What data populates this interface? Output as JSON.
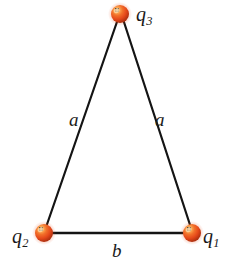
{
  "figure": {
    "type": "physics-diagram",
    "background_color": "#ffffff",
    "width": 232,
    "height": 269
  },
  "style": {
    "sphere_color": "#e8501e",
    "sphere_highlight_color": "#ffd9a8",
    "sphere_shadow_color": "#a32908",
    "line_color": "#141414",
    "label_color": "#1a1a1a",
    "sphere_radius": 9,
    "line_width": 2.2
  },
  "charges": [
    {
      "id": "q1",
      "label": "q",
      "subscript": "1",
      "position": {
        "x": 192,
        "y": 233
      },
      "label_position": "right"
    },
    {
      "id": "q2",
      "label": "q",
      "subscript": "2",
      "position": {
        "x": 44,
        "y": 233
      },
      "label_position": "left"
    },
    {
      "id": "q3",
      "label": "q",
      "subscript": "3",
      "position": {
        "x": 120,
        "y": 14
      },
      "label_position": "right"
    }
  ],
  "sides": [
    {
      "id": "side-left",
      "label": "a",
      "from": "q2",
      "to": "q3",
      "label_position": {
        "x": 69,
        "y": 110
      }
    },
    {
      "id": "side-right",
      "label": "a",
      "from": "q3",
      "to": "q1",
      "label_position": {
        "x": 155,
        "y": 110
      }
    },
    {
      "id": "side-base",
      "label": "b",
      "from": "q2",
      "to": "q1",
      "label_position": {
        "x": 112,
        "y": 241
      }
    }
  ]
}
